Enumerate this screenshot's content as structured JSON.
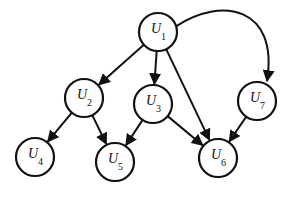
{
  "diagram": {
    "type": "directed-graph",
    "nodes": [
      {
        "id": "U1",
        "letter": "U",
        "sub": "1",
        "x": 158,
        "y": 32
      },
      {
        "id": "U2",
        "letter": "U",
        "sub": "2",
        "x": 84,
        "y": 98
      },
      {
        "id": "U3",
        "letter": "U",
        "sub": "3",
        "x": 153,
        "y": 104
      },
      {
        "id": "U4",
        "letter": "U",
        "sub": "4",
        "x": 35,
        "y": 157
      },
      {
        "id": "U5",
        "letter": "U",
        "sub": "5",
        "x": 115,
        "y": 162
      },
      {
        "id": "U6",
        "letter": "U",
        "sub": "6",
        "x": 218,
        "y": 158
      },
      {
        "id": "U7",
        "letter": "U",
        "sub": "7",
        "x": 257,
        "y": 101
      }
    ],
    "edges": [
      {
        "from": "U1",
        "to": "U2"
      },
      {
        "from": "U1",
        "to": "U3"
      },
      {
        "from": "U1",
        "to": "U6"
      },
      {
        "from": "U1",
        "to": "U7",
        "curved": true
      },
      {
        "from": "U2",
        "to": "U4"
      },
      {
        "from": "U2",
        "to": "U5"
      },
      {
        "from": "U3",
        "to": "U5"
      },
      {
        "from": "U3",
        "to": "U6"
      },
      {
        "from": "U7",
        "to": "U6"
      }
    ],
    "node_radius": 19,
    "stroke_color": "#111111",
    "fill_color": "#ffffff"
  }
}
